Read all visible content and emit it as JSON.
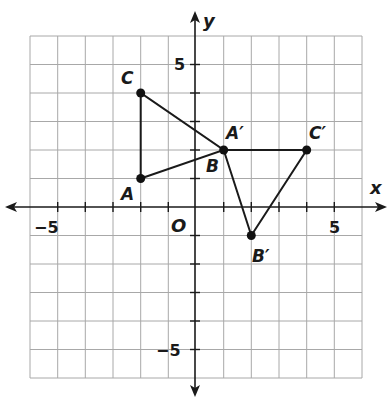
{
  "diagram": {
    "type": "coordinate-plane",
    "axes": {
      "x_label": "x",
      "y_label": "y",
      "origin_label": "O",
      "x_range": [
        -6,
        6
      ],
      "y_range": [
        -6,
        6
      ],
      "tick_labels": {
        "x_neg": "−5",
        "x_pos": "5",
        "y_pos": "5",
        "y_neg": "−5"
      }
    },
    "points": [
      {
        "name": "A",
        "label": "A",
        "x": -2,
        "y": 1
      },
      {
        "name": "B",
        "label": "B",
        "x": 1,
        "y": 2
      },
      {
        "name": "C",
        "label": "C",
        "x": -2,
        "y": 4
      },
      {
        "name": "A'",
        "label": "A′",
        "x": 1,
        "y": 2
      },
      {
        "name": "B'",
        "label": "B′",
        "x": 2,
        "y": -1
      },
      {
        "name": "C'",
        "label": "C′",
        "x": 4,
        "y": 2
      }
    ],
    "triangles": [
      {
        "name": "ABC",
        "vertices": [
          "A",
          "B",
          "C"
        ]
      },
      {
        "name": "A'B'C'",
        "vertices": [
          "A'",
          "B'",
          "C'"
        ]
      }
    ],
    "colors": {
      "grid": "#a8a8a8",
      "ink": "#1a1a1a"
    }
  }
}
